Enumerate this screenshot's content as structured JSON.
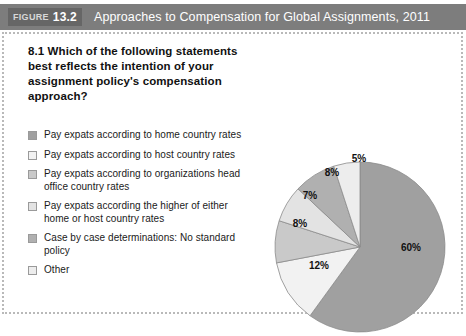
{
  "figure": {
    "badge_word": "FIGURE",
    "badge_number": "13.2",
    "title": "Approaches to Compensation for Global Assignments, 2011"
  },
  "question": "8.1 Which of the following statements best reflects the intention of your assignment policy's compensation approach?",
  "legend": {
    "items": [
      {
        "label": "Pay expats according to home country rates",
        "color": "#a0a0a0"
      },
      {
        "label": "Pay expats according to host country rates",
        "color": "#f2f2f2"
      },
      {
        "label": "Pay expats according to organizations head office country rates",
        "color": "#c9c9c9"
      },
      {
        "label": "Pay expats according the higher of either home or host country rates",
        "color": "#e3e3e3"
      },
      {
        "label": "Case by case determinations: No standard policy",
        "color": "#b0b0b0"
      },
      {
        "label": "Other",
        "color": "#ededed"
      }
    ]
  },
  "chart_data": {
    "type": "pie",
    "title": "Approaches to Compensation for Global Assignments, 2011",
    "unit": "%",
    "legend_position": "left",
    "categories": [
      "Pay expats according to home country rates",
      "Pay expats according to host country rates",
      "Pay expats according to organizations head office country rates",
      "Pay expats according the higher of either home or host country rates",
      "Case by case determinations: No standard policy",
      "Other"
    ],
    "values": [
      60,
      12,
      8,
      7,
      8,
      5
    ],
    "labels": [
      "60%",
      "12%",
      "8%",
      "7%",
      "8%",
      "5%"
    ],
    "colors": [
      "#a0a0a0",
      "#f2f2f2",
      "#c9c9c9",
      "#e3e3e3",
      "#b0b0b0",
      "#ededed"
    ],
    "slice_label_points": [
      {
        "text": "60%",
        "x": 140,
        "y": 125
      },
      {
        "text": "12%",
        "x": 48,
        "y": 143
      },
      {
        "text": "8%",
        "x": 29,
        "y": 101
      },
      {
        "text": "7%",
        "x": 39,
        "y": 73
      },
      {
        "text": "8%",
        "x": 61,
        "y": 50
      },
      {
        "text": "5%",
        "x": 88,
        "y": 36
      }
    ],
    "geometry": {
      "cx": 89,
      "cy": 121,
      "r": 85,
      "start_angle_deg": 0,
      "direction": "clockwise"
    }
  }
}
